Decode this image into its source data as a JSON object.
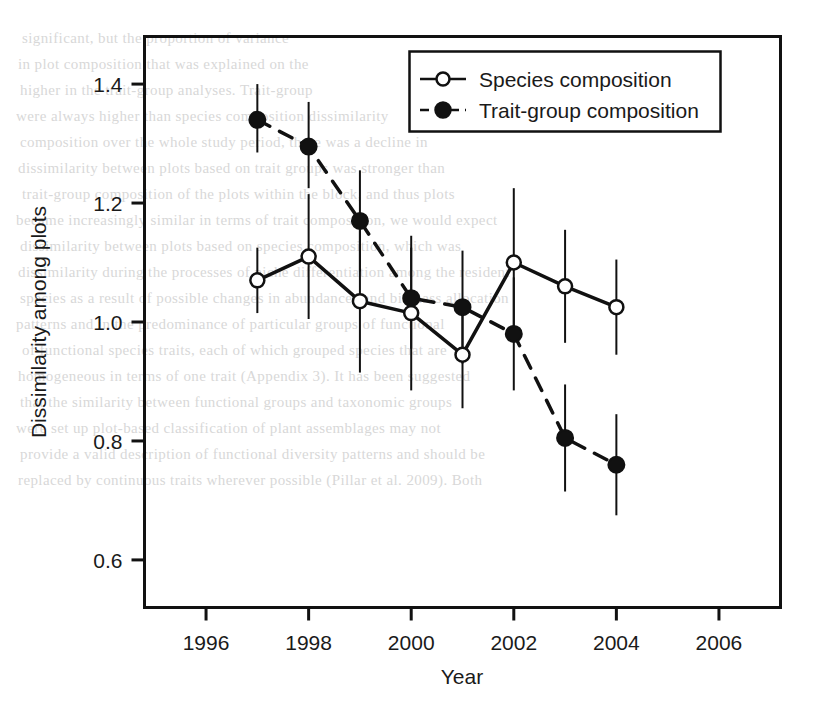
{
  "page": {
    "background_color": "#ffffff",
    "ink_color": "#111111",
    "bleed_text_color": "#b9b9b9",
    "bleed_lines": [
      "significant, but the proportion of variance",
      "in plot composition that was explained on the",
      "higher in the trait-group analyses. Trait-group",
      "were always higher than species composition dissimilarity",
      "composition over the whole study period, there was a decline in",
      "dissimilarity between plots based on trait groups was stronger than",
      "trait-group composition of the plots within the block, and thus plots",
      "became increasingly similar in terms of trait composition, we would expect",
      "dissimilarity between plots based on species composition, which was",
      "dissimilarity during the processes of niche differentiation among the resident",
      "species as a result of possible changes in abundances and biomass allocation",
      "patterns and in the predominance of particular groups of functional",
      "of functional species traits, each of which grouped species that are",
      "homogeneous in terms of one trait (Appendix 3). It has been suggested",
      "that the similarity between functional groups and taxonomic groups",
      "were set up plot-based classification of plant assemblages may not",
      "provide a valid description of functional diversity patterns and should be",
      "replaced by continuous traits wherever possible (Pillar et al. 2009). Both"
    ]
  },
  "chart_data": {
    "type": "line",
    "title": "",
    "xlabel": "Year",
    "ylabel": "Dissimilarity among plots",
    "xlim": [
      1994.8,
      2007.2
    ],
    "ylim": [
      0.52,
      1.48
    ],
    "xticks": [
      1996,
      1998,
      2000,
      2002,
      2004,
      2006
    ],
    "yticks": [
      0.6,
      0.8,
      1.0,
      1.2,
      1.4
    ],
    "ytick_labels": [
      "0.6",
      "0.8",
      "1.0",
      "1.2",
      "1.4"
    ],
    "xtick_labels": [
      "1996",
      "1998",
      "2000",
      "2002",
      "2004",
      "2006"
    ],
    "grid": false,
    "legend_position": "top-right",
    "x": [
      1997,
      1998,
      1999,
      2000,
      2001,
      2002,
      2003,
      2004
    ],
    "series": [
      {
        "name": "Species composition",
        "marker": "open-circle",
        "linestyle": "solid",
        "color": "#111111",
        "values": [
          1.07,
          1.11,
          1.035,
          1.015,
          0.945,
          1.1,
          1.06,
          1.025
        ],
        "err_low": [
          1.015,
          1.005,
          0.915,
          0.885,
          0.855,
          0.975,
          0.965,
          0.945
        ],
        "err_high": [
          1.125,
          1.215,
          1.155,
          1.145,
          1.035,
          1.225,
          1.155,
          1.105
        ]
      },
      {
        "name": "Trait-group composition",
        "marker": "filled-circle",
        "linestyle": "dashed",
        "color": "#111111",
        "values": [
          1.34,
          1.295,
          1.17,
          1.04,
          1.025,
          0.98,
          0.805,
          0.76
        ],
        "err_low": [
          1.285,
          1.225,
          1.085,
          0.955,
          0.93,
          0.885,
          0.715,
          0.675
        ],
        "err_high": [
          1.4,
          1.37,
          1.255,
          1.125,
          1.12,
          1.075,
          0.895,
          0.845
        ]
      }
    ]
  },
  "legend": {
    "entries": [
      {
        "label": "Species composition",
        "marker": "open-circle",
        "linestyle": "solid"
      },
      {
        "label": "Trait-group composition",
        "marker": "filled-circle",
        "linestyle": "dashed"
      }
    ]
  }
}
